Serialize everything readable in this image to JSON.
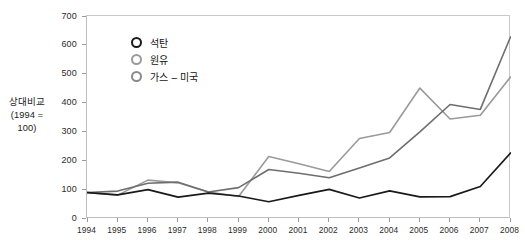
{
  "chart_data": {
    "type": "line",
    "title": "",
    "subtitle": "",
    "xlabel": "",
    "ylabel": "상대비교 (1994 = 100)",
    "ylabel_line1": "상대비교",
    "ylabel_line2": "(1994 = 100)",
    "categories": [
      "1994",
      "1995",
      "1996",
      "1997",
      "1998",
      "1999",
      "2000",
      "2001",
      "2002",
      "2003",
      "2004",
      "2005",
      "2006",
      "2007",
      "2008"
    ],
    "x": [
      1994,
      1995,
      1996,
      1997,
      1998,
      1999,
      2000,
      2001,
      2002,
      2003,
      2004,
      2005,
      2006,
      2007,
      2008
    ],
    "xlim": [
      1994,
      2008
    ],
    "ylim": [
      0,
      700
    ],
    "yticks": [
      0,
      100,
      200,
      300,
      400,
      500,
      600,
      700
    ],
    "ytick_labels": [
      "0",
      "100",
      "200",
      "300",
      "400",
      "500",
      "600",
      "700"
    ],
    "grid": false,
    "legend_position": "upper-left-inside",
    "series": [
      {
        "name": "석탄",
        "color": "#1a1a1a",
        "marker": "circle-open",
        "values": [
          90,
          82,
          100,
          74,
          88,
          78,
          58,
          80,
          101,
          71,
          96,
          75,
          76,
          111,
          227
        ]
      },
      {
        "name": "원유",
        "color": "#9a9a9a",
        "marker": "circle-open",
        "values": [
          90,
          81,
          133,
          124,
          92,
          76,
          215,
          190,
          163,
          277,
          298,
          452,
          345,
          358,
          490
        ]
      },
      {
        "name": "가스 – 미국",
        "color": "#6e6e6e",
        "marker": "circle-open",
        "values": [
          90,
          95,
          122,
          126,
          92,
          107,
          170,
          157,
          141,
          175,
          210,
          300,
          395,
          378,
          629
        ]
      }
    ]
  },
  "legend": {
    "items": [
      {
        "label": "석탄",
        "color": "#1a1a1a"
      },
      {
        "label": "원유",
        "color": "#9a9a9a"
      },
      {
        "label": "가스 – 미국",
        "color": "#8a8a8a"
      }
    ]
  },
  "colors": {
    "coal": "#1a1a1a",
    "crude_oil": "#9a9a9a",
    "gas_us": "#6e6e6e",
    "axis": "#bdbdbd",
    "text": "#1c1c1c",
    "background": "#ffffff"
  }
}
